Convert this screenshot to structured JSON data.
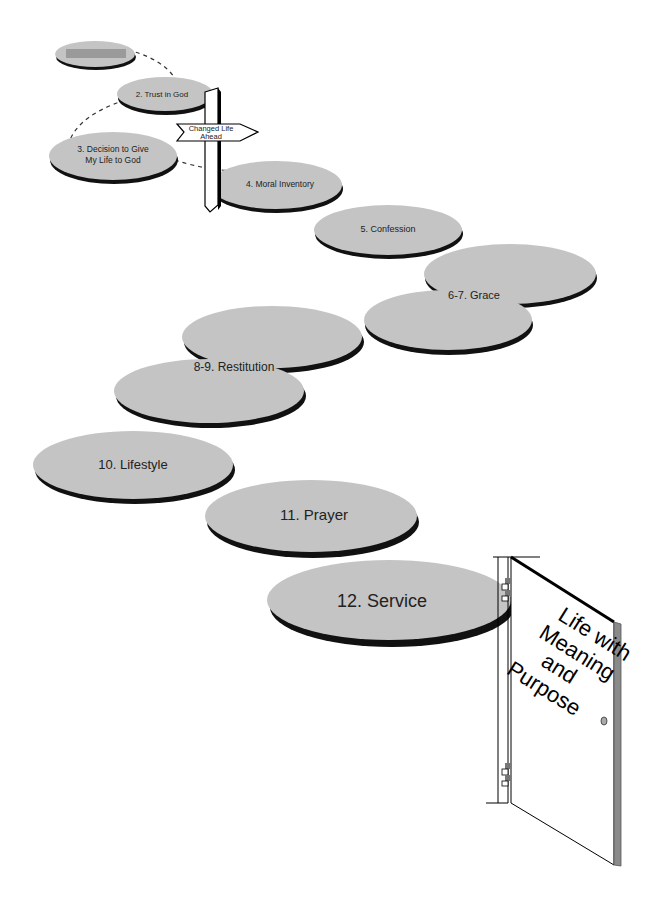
{
  "diagram": {
    "steps": [
      {
        "id": 1,
        "label": ""
      },
      {
        "id": 2,
        "label": "2. Trust in God"
      },
      {
        "id": 3,
        "label_line1": "3. Decision to Give",
        "label_line2": "My Life to God"
      },
      {
        "id": 4,
        "label": "4. Moral Inventory"
      },
      {
        "id": 5,
        "label": "5. Confession"
      },
      {
        "id": 6,
        "label": "6-7. Grace"
      },
      {
        "id": 8,
        "label": "8-9. Restitution"
      },
      {
        "id": 10,
        "label": "10. Lifestyle"
      },
      {
        "id": 11,
        "label": "11. Prayer"
      },
      {
        "id": 12,
        "label": "12. Service"
      }
    ],
    "signpost": {
      "line1": "Changed Life",
      "line2": "Ahead"
    },
    "door": {
      "line1": "Life with",
      "line2": "Meaning",
      "line3": "and",
      "line4": "Purpose"
    },
    "colors": {
      "stone": "#c4c4c4",
      "shadow": "#111111",
      "door_edge": "#8a8a8a",
      "hinge": "#777777"
    }
  }
}
